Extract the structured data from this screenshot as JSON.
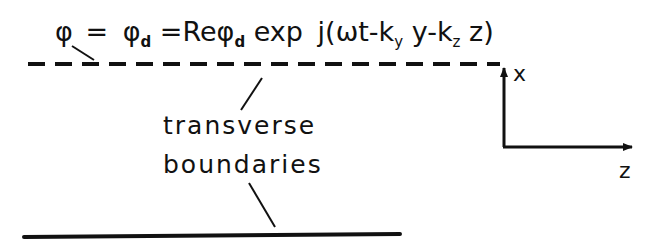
{
  "diagram": {
    "equation": {
      "phi": "φ",
      "eq1": "=",
      "phi_d": "φ",
      "sub_d": "d",
      "eq2": "=",
      "re": "Re",
      "phi_d2": "φ",
      "sub_d2": "d",
      "exp": "exp",
      "arg_start": "j(ωt-k",
      "sub_y": "y",
      "arg_mid": "y-k",
      "sub_z": "z",
      "arg_end": "z)"
    },
    "labels": {
      "line1": "transverse",
      "line2": "boundaries"
    },
    "axes": {
      "x_label": "x",
      "z_label": "z"
    },
    "colors": {
      "ink": "#111111",
      "background": "#ffffff"
    }
  }
}
